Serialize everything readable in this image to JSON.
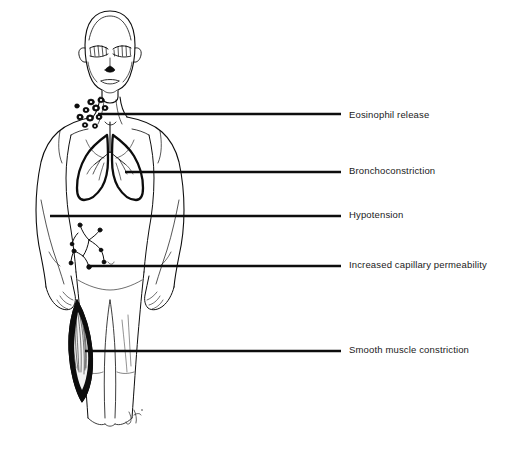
{
  "diagram": {
    "background_color": "#ffffff",
    "line_color": "#000000",
    "text_color": "#1a1a1a",
    "signature": "JR"
  },
  "labels": [
    {
      "id": "eosinophil-release",
      "text": "Eosinophil release",
      "target_region": "neck-base-cell-cluster",
      "leader_line": {
        "x1": 98,
        "y1": 114,
        "x2": 341,
        "y2": 114
      }
    },
    {
      "id": "bronchoconstriction",
      "text": "Bronchoconstriction",
      "target_region": "lungs-bronchial-tree",
      "leader_line": {
        "x1": 125,
        "y1": 172,
        "x2": 341,
        "y2": 172
      }
    },
    {
      "id": "hypotension",
      "text": "Hypotension",
      "target_region": "left-arm-torso",
      "leader_line": {
        "x1": 50,
        "y1": 216,
        "x2": 341,
        "y2": 216
      }
    },
    {
      "id": "increased-capillary-permeability",
      "text": "Increased capillary permeability",
      "target_region": "abdominal-capillary-branching",
      "leader_line": {
        "x1": 87,
        "y1": 266,
        "x2": 341,
        "y2": 266
      }
    },
    {
      "id": "smooth-muscle-constriction",
      "text": "Smooth muscle constriction",
      "target_region": "thigh-spindle-muscle",
      "leader_line": {
        "x1": 85,
        "y1": 351,
        "x2": 341,
        "y2": 351
      }
    }
  ],
  "anatomy_parts": [
    {
      "name": "head",
      "description": "bald head with hatched eyes, nose and mouth"
    },
    {
      "name": "neck",
      "description": "neck with sternocleidomastoid lines"
    },
    {
      "name": "torso",
      "description": "chest and abdomen outline"
    },
    {
      "name": "left-arm",
      "description": "arm hanging with hand at hip"
    },
    {
      "name": "right-arm",
      "description": "arm hanging with hand at hip"
    },
    {
      "name": "lungs",
      "description": "pair of lungs with bronchial tree, thick outline"
    },
    {
      "name": "eosinophil-cells",
      "description": "cluster of small round cells at neck base"
    },
    {
      "name": "capillary-network",
      "description": "branching vessels with terminal bulbs"
    },
    {
      "name": "smooth-muscle",
      "description": "dark fusiform striated muscle on thigh"
    },
    {
      "name": "legs",
      "description": "two legs to mid-calf"
    }
  ]
}
